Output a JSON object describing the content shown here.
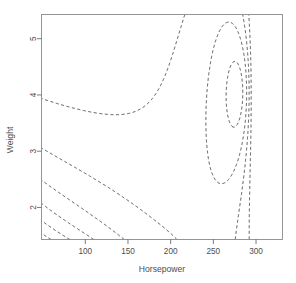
{
  "chart_data": {
    "type": "line",
    "subtype": "contour",
    "title": "",
    "xlabel": "Horsepower",
    "ylabel": "Weight",
    "xlim": [
      48.7,
      331.0
    ],
    "ylim": [
      1.43,
      5.43
    ],
    "xticks": [
      100,
      150,
      200,
      250,
      300
    ],
    "xticklabels": [
      "100",
      "150",
      "200",
      "250",
      "300"
    ],
    "yticks": [
      2,
      3,
      4,
      5
    ],
    "yticklabels": [
      "2",
      "3",
      "4",
      "5"
    ],
    "grid": false,
    "legend": null,
    "linestyle": "dashed",
    "line_color": "#3b3b3b",
    "frame_color": "#8a8a8a",
    "levels": [
      5,
      10,
      15,
      20,
      25,
      30,
      35,
      40,
      45,
      50,
      55,
      60,
      65,
      70,
      75,
      80,
      85,
      90,
      95,
      100,
      105,
      110,
      115,
      120,
      125,
      130
    ],
    "surface_note": "Fuel efficiency (mpg) response surface over Horsepower and Weight; high values at low horsepower / low weight, saddle near 300 hp.",
    "model": {
      "kind": "rational_saddle",
      "coefficients": {
        "a0": 38.0,
        "a_hp": -0.118,
        "a_wt": -4.6,
        "a_hp2": 0.000255,
        "a_wt2": 0.62,
        "a_hpwt": 0.0125
      }
    }
  },
  "axes": {
    "x_title": "Horsepower",
    "y_title": "Weight"
  }
}
